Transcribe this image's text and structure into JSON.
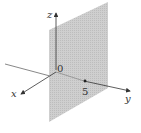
{
  "figure": {
    "axes": {
      "x_label": "x",
      "y_label": "y",
      "z_label": "z",
      "origin_label": "0"
    },
    "plane": {
      "equation": "y = 5",
      "marked_point_label": "5",
      "fill_color": "#c8c8c8"
    },
    "colors": {
      "axis": "#444444",
      "text": "#333333",
      "plane": "#c8c8c8"
    }
  }
}
